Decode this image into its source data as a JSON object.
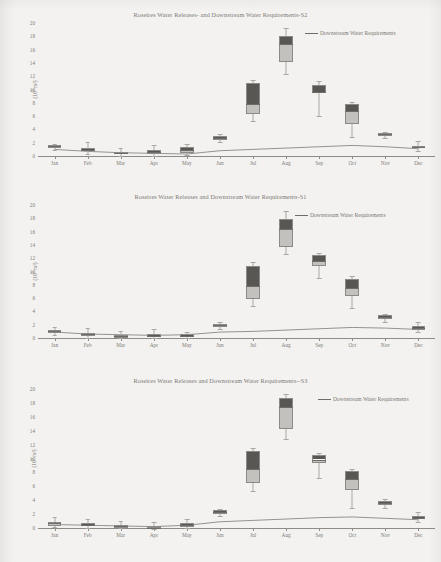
{
  "document": {
    "kind": "scanned-figure-page",
    "figure_count": 3
  },
  "axis": {
    "y_label": "(10⁹ m³)",
    "y_label_base": "(10",
    "y_label_exp": "9",
    "y_label_tail": " m³)",
    "y_ticks": [
      0,
      2,
      4,
      6,
      8,
      10,
      12,
      14,
      16,
      18,
      20
    ],
    "x_ticks": [
      "Jan",
      "Feb",
      "Mar",
      "Apr",
      "May",
      "Jun",
      "Jul",
      "Aug",
      "Sep",
      "Oct",
      "Nov",
      "Dec"
    ]
  },
  "legend": {
    "label": "Downstream Water Requirements",
    "icon": "line-swatch-icon"
  },
  "colors": {
    "box_upper": "#585754",
    "box_lower": "#c2c1bd",
    "box_border": "#8c8a87",
    "whisker": "#a9a7a4",
    "line": "#7c7a77",
    "axis": "#8d8b88",
    "text": "#7b7975",
    "page": "#f3f2f0"
  },
  "charts": [
    {
      "id": "S2",
      "title": "Roseires Water Releases- and Downstream Water Requirements-S2",
      "ylim": [
        0,
        20
      ],
      "chart_data": {
        "type": "box",
        "title": "Roseires Water Releases- and Downstream Water Requirements-S2",
        "xlabel": "",
        "ylabel": "(10⁹ m³)",
        "ylim": [
          0,
          20
        ],
        "grid": false,
        "legend_position": "top-right",
        "categories": [
          "Jan",
          "Feb",
          "Mar",
          "Apr",
          "May",
          "Jun",
          "Jul",
          "Aug",
          "Sep",
          "Oct",
          "Nov",
          "Dec"
        ],
        "series": [
          {
            "name": "Roseires Water Releases",
            "type": "box",
            "boxes": [
              {
                "x": "Jan",
                "whisker_low": 1.0,
                "q1": 1.3,
                "median": 1.6,
                "q3": 1.8,
                "whisker_high": 2.0
              },
              {
                "x": "Feb",
                "whisker_low": 0.5,
                "q1": 0.9,
                "median": 1.1,
                "q3": 1.4,
                "whisker_high": 2.2
              },
              {
                "x": "Mar",
                "whisker_low": 0.2,
                "q1": 0.4,
                "median": 0.6,
                "q3": 0.8,
                "whisker_high": 1.4
              },
              {
                "x": "Apr",
                "whisker_low": 0.1,
                "q1": 0.4,
                "median": 0.7,
                "q3": 1.0,
                "whisker_high": 1.8
              },
              {
                "x": "May",
                "whisker_low": 0.3,
                "q1": 0.6,
                "median": 1.0,
                "q3": 1.5,
                "whisker_high": 2.0
              },
              {
                "x": "Jun",
                "whisker_low": 2.2,
                "q1": 2.5,
                "median": 2.9,
                "q3": 3.2,
                "whisker_high": 3.4
              },
              {
                "x": "Jul",
                "whisker_low": 5.4,
                "q1": 6.5,
                "median": 8.0,
                "q3": 11.2,
                "whisker_high": 11.6
              },
              {
                "x": "Aug",
                "whisker_low": 12.5,
                "q1": 14.3,
                "median": 17.0,
                "q3": 18.2,
                "whisker_high": 19.4
              },
              {
                "x": "Sep",
                "whisker_low": 6.2,
                "q1": 9.6,
                "median": 9.8,
                "q3": 10.9,
                "whisker_high": 11.4
              },
              {
                "x": "Oct",
                "whisker_low": 3.0,
                "q1": 4.9,
                "median": 6.9,
                "q3": 8.0,
                "whisker_high": 8.3
              },
              {
                "x": "Nov",
                "whisker_low": 2.9,
                "q1": 3.2,
                "median": 3.4,
                "q3": 3.6,
                "whisker_high": 3.8
              },
              {
                "x": "Dec",
                "whisker_low": 0.9,
                "q1": 1.3,
                "median": 1.5,
                "q3": 1.7,
                "whisker_high": 2.4
              }
            ]
          },
          {
            "name": "Downstream Water Requirements",
            "type": "line",
            "values": [
              1.0,
              0.7,
              0.5,
              0.4,
              0.3,
              0.8,
              1.0,
              1.2,
              1.4,
              1.6,
              1.4,
              1.1
            ]
          }
        ]
      }
    },
    {
      "id": "S1",
      "title": "Roseires Water Releases and Downstream Water Requirements-S1",
      "ylim": [
        0,
        20
      ],
      "chart_data": {
        "type": "box",
        "title": "Roseires Water Releases and Downstream Water Requirements-S1",
        "xlabel": "",
        "ylabel": "(10⁹ m³)",
        "ylim": [
          0,
          20
        ],
        "grid": false,
        "legend_position": "top-right",
        "categories": [
          "Jan",
          "Feb",
          "Mar",
          "Apr",
          "May",
          "Jun",
          "Jul",
          "Aug",
          "Sep",
          "Oct",
          "Nov",
          "Dec"
        ],
        "series": [
          {
            "name": "Roseires Water Releases",
            "type": "box",
            "boxes": [
              {
                "x": "Jan",
                "whisker_low": 0.6,
                "q1": 0.9,
                "median": 1.2,
                "q3": 1.4,
                "whisker_high": 1.8
              },
              {
                "x": "Feb",
                "whisker_low": 0.2,
                "q1": 0.5,
                "median": 0.7,
                "q3": 0.9,
                "whisker_high": 1.6
              },
              {
                "x": "Mar",
                "whisker_low": 0.1,
                "q1": 0.2,
                "median": 0.4,
                "q3": 0.6,
                "whisker_high": 1.2
              },
              {
                "x": "Apr",
                "whisker_low": 0.1,
                "q1": 0.3,
                "median": 0.5,
                "q3": 0.8,
                "whisker_high": 1.5
              },
              {
                "x": "May",
                "whisker_low": 0.1,
                "q1": 0.3,
                "median": 0.5,
                "q3": 0.8,
                "whisker_high": 1.0
              },
              {
                "x": "Jun",
                "whisker_low": 1.5,
                "q1": 1.8,
                "median": 2.1,
                "q3": 2.3,
                "whisker_high": 2.5
              },
              {
                "x": "Jul",
                "whisker_low": 5.0,
                "q1": 6.0,
                "median": 8.0,
                "q3": 11.0,
                "whisker_high": 11.6
              },
              {
                "x": "Aug",
                "whisker_low": 12.8,
                "q1": 13.8,
                "median": 16.5,
                "q3": 18.0,
                "whisker_high": 19.3
              },
              {
                "x": "Sep",
                "whisker_low": 9.2,
                "q1": 11.0,
                "median": 11.8,
                "q3": 12.6,
                "whisker_high": 13.0
              },
              {
                "x": "Oct",
                "whisker_low": 4.6,
                "q1": 6.4,
                "median": 7.6,
                "q3": 9.0,
                "whisker_high": 9.4
              },
              {
                "x": "Nov",
                "whisker_low": 2.6,
                "q1": 3.0,
                "median": 3.3,
                "q3": 3.6,
                "whisker_high": 3.8
              },
              {
                "x": "Dec",
                "whisker_low": 1.0,
                "q1": 1.4,
                "median": 1.7,
                "q3": 2.0,
                "whisker_high": 2.6
              }
            ]
          },
          {
            "name": "Downstream Water Requirements",
            "type": "line",
            "values": [
              0.9,
              0.6,
              0.5,
              0.4,
              0.5,
              0.9,
              1.0,
              1.2,
              1.4,
              1.6,
              1.5,
              1.3
            ]
          }
        ]
      }
    },
    {
      "id": "S3",
      "title": "Roseires Water Releases  and Downstream Water Requirements--S3",
      "ylim": [
        0,
        20
      ],
      "chart_data": {
        "type": "box",
        "title": "Roseires Water Releases  and Downstream Water Requirements--S3",
        "xlabel": "",
        "ylabel": "(10⁹ m³)",
        "ylim": [
          0,
          20
        ],
        "grid": false,
        "legend_position": "top-right",
        "categories": [
          "Jan",
          "Feb",
          "Mar",
          "Apr",
          "May",
          "Jun",
          "Jul",
          "Aug",
          "Sep",
          "Oct",
          "Nov",
          "Dec"
        ],
        "series": [
          {
            "name": "Roseires Water Releases",
            "type": "box",
            "boxes": [
              {
                "x": "Jan",
                "whisker_low": 0.3,
                "q1": 0.5,
                "median": 0.8,
                "q3": 1.0,
                "whisker_high": 1.7
              },
              {
                "x": "Feb",
                "whisker_low": 0.2,
                "q1": 0.4,
                "median": 0.6,
                "q3": 0.8,
                "whisker_high": 1.4
              },
              {
                "x": "Mar",
                "whisker_low": 0.1,
                "q1": 0.2,
                "median": 0.4,
                "q3": 0.6,
                "whisker_high": 1.2
              },
              {
                "x": "Apr",
                "whisker_low": 0.0,
                "q1": 0.1,
                "median": 0.2,
                "q3": 0.4,
                "whisker_high": 1.0
              },
              {
                "x": "May",
                "whisker_low": 0.1,
                "q1": 0.3,
                "median": 0.6,
                "q3": 0.9,
                "whisker_high": 1.4
              },
              {
                "x": "Jun",
                "whisker_low": 1.9,
                "q1": 2.2,
                "median": 2.4,
                "q3": 2.7,
                "whisker_high": 2.9
              },
              {
                "x": "Jul",
                "whisker_low": 5.4,
                "q1": 6.6,
                "median": 8.6,
                "q3": 11.2,
                "whisker_high": 11.6
              },
              {
                "x": "Aug",
                "whisker_low": 13.0,
                "q1": 14.4,
                "median": 17.5,
                "q3": 18.8,
                "whisker_high": 19.4
              },
              {
                "x": "Sep",
                "whisker_low": 7.4,
                "q1": 9.5,
                "median": 10.0,
                "q3": 10.6,
                "whisker_high": 10.9
              },
              {
                "x": "Oct",
                "whisker_low": 3.0,
                "q1": 5.6,
                "median": 7.2,
                "q3": 8.4,
                "whisker_high": 8.7
              },
              {
                "x": "Nov",
                "whisker_low": 3.0,
                "q1": 3.4,
                "median": 3.7,
                "q3": 4.0,
                "whisker_high": 4.3
              },
              {
                "x": "Dec",
                "whisker_low": 1.0,
                "q1": 1.4,
                "median": 1.6,
                "q3": 1.9,
                "whisker_high": 2.4
              }
            ]
          },
          {
            "name": "Downstream Water Requirements",
            "type": "line",
            "values": [
              0.5,
              0.4,
              0.3,
              0.2,
              0.4,
              0.9,
              1.1,
              1.3,
              1.5,
              1.6,
              1.4,
              1.2
            ]
          }
        ]
      }
    }
  ]
}
